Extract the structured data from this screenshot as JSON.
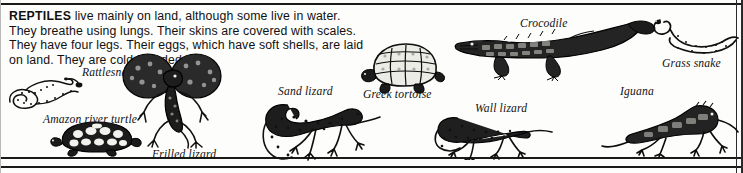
{
  "document": {
    "heading_term": "REPTILES",
    "body_lines": [
      "live mainly on land, although some live in water.",
      "They breathe using lungs. Their skins are covered with scales.",
      "They have four legs. Their eggs, which have soft shells, are laid",
      "on land. They are cold-blooded."
    ],
    "body_full": "REPTILES live mainly on land, although some live in water. They breathe using lungs. Their skins are covered with scales. They have four legs. Their eggs, which have soft shells, are laid on land. They are cold-blooded."
  },
  "figures": [
    {
      "id": "rattlesnake",
      "caption": "Rattlesnake"
    },
    {
      "id": "amazon-river-turtle",
      "caption": "Amazon river turtle"
    },
    {
      "id": "frilled-lizard",
      "caption": "Frilled lizard"
    },
    {
      "id": "sand-lizard",
      "caption": "Sand lizard"
    },
    {
      "id": "greek-tortoise",
      "caption": "Greek tortoise"
    },
    {
      "id": "crocodile",
      "caption": "Crocodile"
    },
    {
      "id": "grass-snake",
      "caption": "Grass snake"
    },
    {
      "id": "wall-lizard",
      "caption": "Wall lizard"
    },
    {
      "id": "iguana",
      "caption": "Iguana"
    }
  ],
  "colors": {
    "ink": "#1a1a1a",
    "paper": "#fdfdfb",
    "text": "#111111"
  }
}
